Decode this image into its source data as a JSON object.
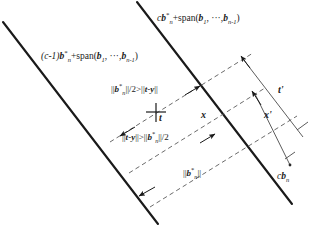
{
  "figure": {
    "background_color": "#ffffff",
    "line_color": "#1a1a1a",
    "dash_color": "#555555",
    "width": 327,
    "height": 226
  },
  "planes": {
    "upper_label": "cb*n+span(b1, ···, bn-1)",
    "upper_parts": {
      "coef": "c",
      "base": "b",
      "star": "*",
      "sub": "n",
      "plus": "+span(",
      "b1": "b",
      "sub1": "1",
      "sep": ", ···,",
      "b2": "b",
      "sub2": "n-1",
      "close": ")"
    },
    "lower_label": "(c-1)b*n+span(b1, ···, bn-1)",
    "lower_parts": {
      "coef": "(c-1)",
      "base": "b",
      "star": "*",
      "sub": "n",
      "plus": "+span(",
      "b1": "b",
      "sub1": "1",
      "sep": ", ···,",
      "b2": "b",
      "sub2": "n-1",
      "close": ")"
    }
  },
  "inequalities": {
    "upper": "||b*n||/2 > ||t-y||",
    "upper_parts": {
      "lead": "||",
      "b": "b",
      "star": "*",
      "sub": "n",
      "mid": "||/2",
      "rel": ">",
      "tail_open": "||",
      "t": "t",
      "minus": "-",
      "y": "y",
      "tail_close": "||"
    },
    "lower": "||t-y|| > ||b*n||/2",
    "lower_parts": {
      "lead": "||",
      "t": "t",
      "minus": "-",
      "y": "y",
      "mid": "||",
      "rel": ">",
      "tail_open": "||",
      "b": "b",
      "star": "*",
      "sub": "n",
      "tail_close": "||/2"
    }
  },
  "norm_label": {
    "text": "||b*n||",
    "parts": {
      "lead": "||",
      "b": "b",
      "star": "*",
      "sub": "n",
      "close": "||"
    }
  },
  "points": {
    "t": "t",
    "x": "x",
    "t_prime": "t'",
    "x_prime": "x'",
    "cbn": "cbn",
    "cbn_parts": {
      "c": "c",
      "b": "b",
      "sub": "n"
    }
  }
}
